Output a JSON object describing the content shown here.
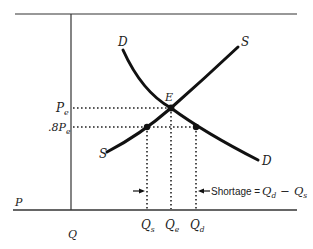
{
  "diagram": {
    "colors": {
      "ink": "#1a1a1a",
      "background": "#ffffff"
    },
    "axes": {
      "price_axis_label": "P",
      "quantity_axis_label": "Q"
    },
    "curves": {
      "demand": {
        "label_top": "D",
        "label_bottom": "D"
      },
      "supply": {
        "label_top": "S",
        "label_bottom": "S"
      }
    },
    "points": {
      "equilibrium": {
        "label": "E"
      }
    },
    "price_levels": {
      "equilibrium": {
        "main": "P",
        "sub": "e"
      },
      "ceiling": {
        "prefix": ".8",
        "main": "P",
        "sub": "e"
      }
    },
    "quantity_levels": [
      {
        "main": "Q",
        "sub": "s"
      },
      {
        "main": "Q",
        "sub": "e"
      },
      {
        "main": "Q",
        "sub": "d"
      }
    ],
    "annotation": {
      "text": "Shortage = ",
      "formula_a_main": "Q",
      "formula_a_sub": "d",
      "minus": "−",
      "formula_b_main": "Q",
      "formula_b_sub": "s"
    }
  }
}
